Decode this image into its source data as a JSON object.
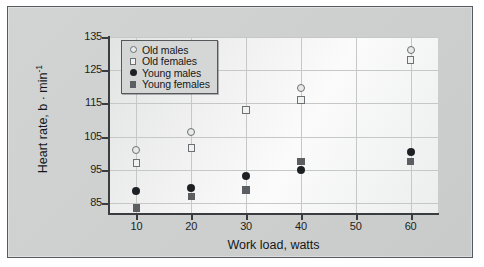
{
  "figure": {
    "background_color": "#ffffff",
    "card_color": "#d0d2d2",
    "card_border_color": "#555b5e"
  },
  "chart_data": {
    "type": "scatter",
    "title": "",
    "xlabel": "Work load, watts",
    "ylabel": "Heart rate, b · min",
    "ylabel_superscript": "-1",
    "x": [
      10,
      20,
      30,
      40,
      60
    ],
    "xticks": [
      10,
      20,
      30,
      40,
      50,
      60
    ],
    "yticks": [
      85,
      95,
      105,
      115,
      125,
      135
    ],
    "xlim": [
      5,
      65
    ],
    "ylim": [
      82,
      135
    ],
    "grid": true,
    "legend_position": "upper left",
    "series": [
      {
        "name": "Old males",
        "marker": "circle-open",
        "color": "#6d7173",
        "x": [
          10,
          20,
          30,
          40,
          60
        ],
        "values": [
          101,
          106.5,
          113,
          119.5,
          131
        ]
      },
      {
        "name": "Old females",
        "marker": "square-open",
        "color": "#6d7173",
        "x": [
          10,
          20,
          30,
          40,
          60
        ],
        "values": [
          97,
          101.5,
          113,
          116,
          128
        ]
      },
      {
        "name": "Young males",
        "marker": "circle-filled",
        "color": "#1e2123",
        "x": [
          10,
          20,
          30,
          40,
          60
        ],
        "values": [
          88.5,
          89.5,
          93,
          95,
          100.5
        ]
      },
      {
        "name": "Young females",
        "marker": "square-filled",
        "color": "#5b5f61",
        "x": [
          10,
          20,
          30,
          40,
          60
        ],
        "values": [
          83.5,
          87,
          89,
          97.5,
          97.5
        ]
      }
    ]
  }
}
